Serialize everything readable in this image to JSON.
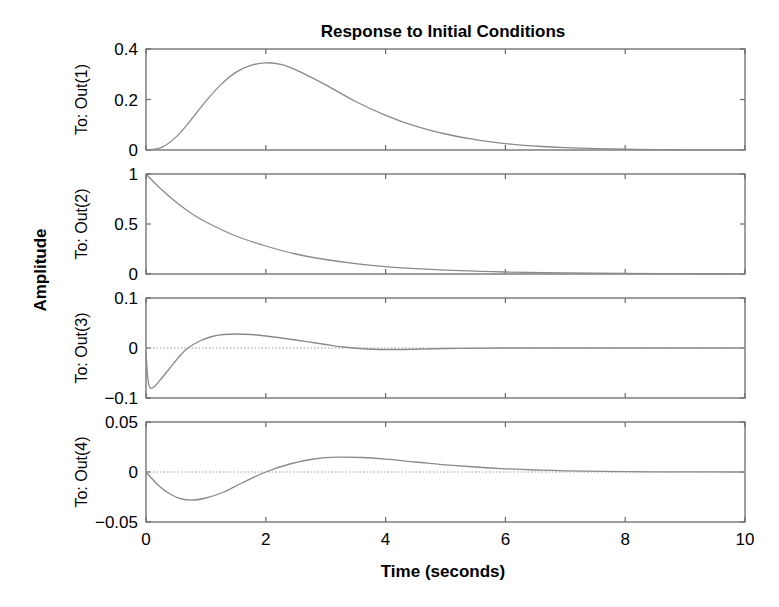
{
  "chart_data": {
    "type": "line",
    "title": "Response to Initial Conditions",
    "xlabel": "Time (seconds)",
    "ylabel": "Amplitude",
    "xlim": [
      0,
      10
    ],
    "xticks": [
      0,
      2,
      4,
      6,
      8,
      10
    ],
    "xtick_labels": [
      "0",
      "2",
      "4",
      "6",
      "8",
      "10"
    ],
    "grid": false,
    "legend": null,
    "subplots": [
      {
        "ylabel": "To: Out(1)",
        "ylim": [
          0,
          0.4
        ],
        "yticks": [
          0,
          0.2,
          0.4
        ],
        "ytick_labels": [
          "0",
          "0.2",
          "0.4"
        ],
        "zero_line": false,
        "x": [
          0,
          0.25,
          0.5,
          0.75,
          1,
          1.25,
          1.5,
          1.75,
          2,
          2.25,
          2.5,
          2.75,
          3,
          3.5,
          4,
          4.5,
          5,
          5.5,
          6,
          6.5,
          7,
          8,
          9,
          10
        ],
        "y": [
          0,
          0.0093,
          0.0512,
          0.1188,
          0.1935,
          0.2591,
          0.3074,
          0.3352,
          0.3453,
          0.3393,
          0.3178,
          0.2888,
          0.2579,
          0.192,
          0.1375,
          0.0943,
          0.0632,
          0.0406,
          0.0255,
          0.0155,
          0.0092,
          0.003,
          0.0009,
          0.0003
        ]
      },
      {
        "ylabel": "To: Out(2)",
        "ylim": [
          0,
          1
        ],
        "yticks": [
          0,
          0.5,
          1
        ],
        "ytick_labels": [
          "0",
          "0.5",
          "1"
        ],
        "zero_line": false,
        "x": [
          0,
          0.25,
          0.5,
          0.75,
          1,
          1.5,
          2,
          2.5,
          3,
          3.5,
          4,
          4.5,
          5,
          5.5,
          6,
          7,
          8,
          9,
          10
        ],
        "y": [
          1.0,
          0.85,
          0.72,
          0.61,
          0.52,
          0.38,
          0.28,
          0.2,
          0.145,
          0.103,
          0.074,
          0.054,
          0.039,
          0.028,
          0.02,
          0.011,
          0.006,
          0.003,
          0.0015
        ]
      },
      {
        "ylabel": "To: Out(3)",
        "ylim": [
          -0.1,
          0.1
        ],
        "yticks": [
          -0.1,
          0,
          0.1
        ],
        "ytick_labels": [
          "−0.1",
          "0",
          "0.1"
        ],
        "zero_line": true,
        "x": [
          0,
          0.03,
          0.07,
          0.15,
          0.25,
          0.4,
          0.55,
          0.7,
          0.9,
          1.1,
          1.3,
          1.5,
          1.75,
          2.0,
          2.5,
          3.0,
          3.3,
          3.7,
          4.2,
          5.0,
          6.0,
          8.0,
          10.0
        ],
        "y": [
          -0.01,
          -0.06,
          -0.08,
          -0.076,
          -0.062,
          -0.04,
          -0.018,
          0.0,
          0.014,
          0.023,
          0.027,
          0.028,
          0.027,
          0.024,
          0.016,
          0.007,
          0.002,
          -0.002,
          -0.003,
          -0.001,
          0.0,
          0.0,
          0.0
        ]
      },
      {
        "ylabel": "To: Out(4)",
        "ylim": [
          -0.05,
          0.05
        ],
        "yticks": [
          -0.05,
          0,
          0.05
        ],
        "ytick_labels": [
          "−0.05",
          "0",
          "0.05"
        ],
        "zero_line": true,
        "x": [
          0,
          0.2,
          0.4,
          0.6,
          0.8,
          1.0,
          1.3,
          1.6,
          2.0,
          2.4,
          2.8,
          3.2,
          3.6,
          4.0,
          4.5,
          5.0,
          5.5,
          6.0,
          6.5,
          7.0,
          8.0,
          9.0,
          10.0
        ],
        "y": [
          0,
          -0.013,
          -0.022,
          -0.027,
          -0.028,
          -0.026,
          -0.02,
          -0.011,
          0.0,
          0.008,
          0.013,
          0.0148,
          0.0145,
          0.0128,
          0.01,
          0.0072,
          0.005,
          0.0032,
          0.002,
          0.0012,
          0.0004,
          0.0001,
          0.0
        ]
      }
    ]
  }
}
